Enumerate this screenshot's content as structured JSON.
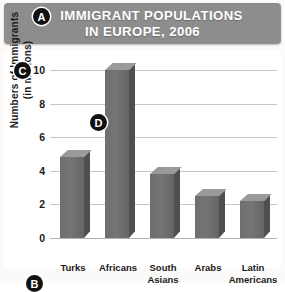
{
  "header": {
    "title_line1": "IMMIGRANT POPULATIONS",
    "title_line2": "IN EUROPE, 2006",
    "bar_color": "#8d8d8d"
  },
  "markers": {
    "a": "A",
    "b": "B",
    "c": "C",
    "d": "D"
  },
  "chart_data": {
    "type": "bar",
    "title": "IMMIGRANT POPULATIONS IN EUROPE, 2006",
    "xlabel": "",
    "ylabel": "Numbers of Immigrants (in millions)",
    "ylabel_line1": "Numbers of Immigrants",
    "ylabel_line2": "(in millions)",
    "categories": [
      "Turks",
      "Africans",
      "South Asians",
      "Arabs",
      "Latin Americans"
    ],
    "category_lines": [
      [
        "Turks"
      ],
      [
        "Africans"
      ],
      [
        "South",
        "Asians"
      ],
      [
        "Arabs"
      ],
      [
        "Latin",
        "Americans"
      ]
    ],
    "values": [
      4.8,
      10.0,
      3.8,
      2.5,
      2.2
    ],
    "ylim": [
      0,
      10
    ],
    "yticks": [
      0,
      2,
      4,
      6,
      8,
      10
    ],
    "ytick_labels": [
      "0",
      "2",
      "4",
      "6",
      "8",
      "10"
    ],
    "grid": true,
    "legend": "none",
    "bar_color": "#717171",
    "bar_top_color": "#9a9a9a",
    "bar_side_color": "#4f4f4f",
    "gridline_color": "#c9c7c3"
  }
}
